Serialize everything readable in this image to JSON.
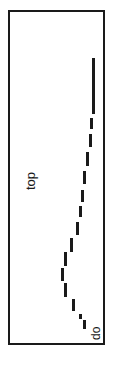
{
  "figure": {
    "name": "dashed-curve-plot",
    "orientation": "rotated-90",
    "background_color": "#ffffff",
    "ink_color": "#1a1a1a",
    "frame": {
      "x": 8,
      "y": 10,
      "width": 97,
      "height": 335,
      "border_width": 2,
      "border_color": "#1a1a1a"
    },
    "labels": {
      "top_label": "top",
      "bottom_label": "do"
    }
  },
  "chart_data": {
    "type": "line",
    "title": "",
    "subtitle": "",
    "xlabel": "",
    "ylabel": "",
    "annotations": [
      "top",
      "do"
    ],
    "legend": [],
    "grid": false,
    "line_style": "dashed",
    "series": [
      {
        "name": "profile",
        "description": "dashed curve descending from upper right, bowing left toward lower middle, then returning right at the bottom",
        "segments": [
          {
            "x": 92,
            "y": 58,
            "length": 56,
            "thickness": 3
          },
          {
            "x": 90,
            "y": 118,
            "length": 11,
            "thickness": 3
          },
          {
            "x": 89,
            "y": 134,
            "length": 13,
            "thickness": 3
          },
          {
            "x": 86,
            "y": 152,
            "length": 14,
            "thickness": 3
          },
          {
            "x": 83,
            "y": 171,
            "length": 13,
            "thickness": 3
          },
          {
            "x": 81,
            "y": 190,
            "length": 12,
            "thickness": 3
          },
          {
            "x": 79,
            "y": 206,
            "length": 11,
            "thickness": 3
          },
          {
            "x": 76,
            "y": 222,
            "length": 13,
            "thickness": 3
          },
          {
            "x": 70,
            "y": 238,
            "length": 14,
            "thickness": 3
          },
          {
            "x": 64,
            "y": 252,
            "length": 14,
            "thickness": 3
          },
          {
            "x": 61,
            "y": 268,
            "length": 13,
            "thickness": 3
          },
          {
            "x": 64,
            "y": 283,
            "length": 14,
            "thickness": 3
          },
          {
            "x": 72,
            "y": 299,
            "length": 12,
            "thickness": 3
          },
          {
            "x": 79,
            "y": 314,
            "length": 5,
            "thickness": 3
          },
          {
            "x": 83,
            "y": 320,
            "length": 9,
            "thickness": 3
          }
        ]
      }
    ],
    "xlim": [
      8,
      105
    ],
    "ylim": [
      10,
      345
    ]
  }
}
